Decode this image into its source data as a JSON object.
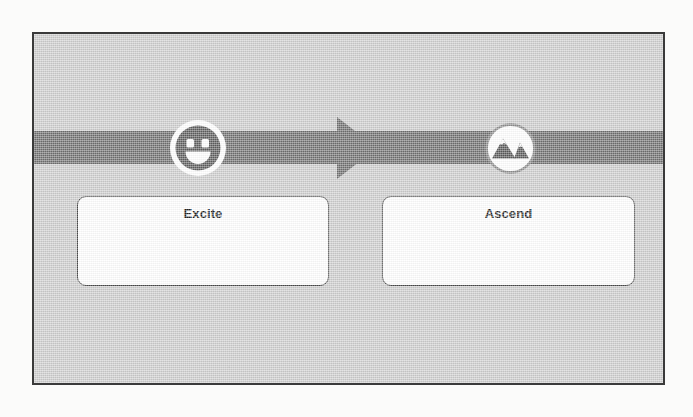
{
  "slide": {
    "background_color": "#cdcdcd",
    "border_color": "#3a3a3a",
    "band_color": "#6f6f6f",
    "box_fill_color": "#ffffff",
    "box_border_color": "#4a4a4a",
    "title_text_color": "#222222"
  },
  "diagram": {
    "type": "two-stage-process",
    "band_label": "",
    "arrow": {
      "name": "stage-arrow",
      "direction": "right",
      "color": "#6f6f6f"
    },
    "stages": [
      {
        "id": "excite",
        "title": "Excite",
        "body": "",
        "icon_name": "smiley-face-icon",
        "icon_style": "dark-circle-white-ring"
      },
      {
        "id": "ascend",
        "title": "Ascend",
        "body": "",
        "icon_name": "mountains-icon",
        "icon_style": "white-circle-dark-mountains"
      }
    ]
  }
}
